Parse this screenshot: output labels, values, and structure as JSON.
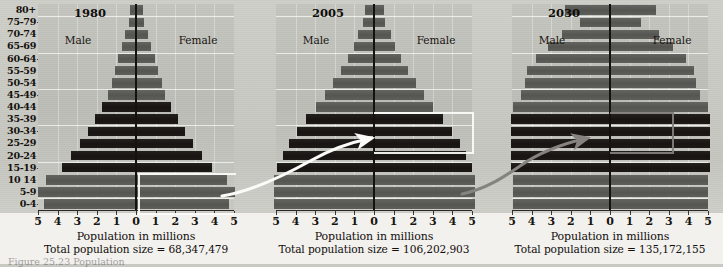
{
  "figure": {
    "age_groups": [
      "80+",
      "75-79",
      "70-74",
      "65-69",
      "60-64",
      "55-59",
      "50-54",
      "45-49",
      "40-44",
      "35-39",
      "30-34",
      "25-29",
      "20-24",
      "15-19",
      "10 14",
      "5-9",
      "0-4"
    ],
    "x_tick_labels": [
      "5",
      "4",
      "3",
      "2",
      "1",
      "0",
      "1",
      "2",
      "3",
      "4",
      "5"
    ],
    "axis_caption": "Population in millions",
    "male_label": "Male",
    "female_label": "Female",
    "colors": {
      "bar_dark": "#1a1715",
      "bar_mid": "#5a5a56",
      "plot_background": "#c2c2bc",
      "page_background": "#cfcfc9",
      "gridline": "#ffffff",
      "axis": "#14110f",
      "arrow_white": "#fbfbf9",
      "arrow_gray": "#807e7a"
    },
    "partial_bottom_caption": "Figure  25.23   Population"
  },
  "chart_data": [
    {
      "type": "bar",
      "title": "1980",
      "subtitle": "Total population size = 68,347,479",
      "total_population": "68,347,479",
      "xlabel": "Population in millions",
      "ylabel": "",
      "xlim": [
        -5,
        5
      ],
      "grid": true,
      "legend_position": "inline-left-right",
      "categories": [
        "80+",
        "75-79",
        "70-74",
        "65-69",
        "60-64",
        "55-59",
        "50-54",
        "45-49",
        "40-44",
        "35-39",
        "30-34",
        "25-29",
        "20-24",
        "15-19",
        "10 14",
        "5-9",
        "0-4"
      ],
      "series": [
        {
          "name": "Male",
          "values": [
            0.3,
            0.35,
            0.55,
            0.7,
            0.9,
            1.05,
            1.25,
            1.45,
            1.75,
            2.1,
            2.45,
            2.85,
            3.3,
            3.8,
            4.6,
            5.0,
            4.7
          ]
        },
        {
          "name": "Female",
          "values": [
            0.35,
            0.4,
            0.6,
            0.75,
            0.95,
            1.1,
            1.3,
            1.5,
            1.8,
            2.15,
            2.5,
            2.9,
            3.35,
            3.85,
            4.65,
            5.05,
            4.75
          ]
        }
      ],
      "bar_shades": [
        "mid",
        "mid",
        "mid",
        "mid",
        "mid",
        "mid",
        "mid",
        "mid",
        "dark",
        "dark",
        "dark",
        "dark",
        "dark",
        "dark",
        "mid",
        "mid",
        "mid"
      ],
      "annotation": "white bracket around 0-4 / 5-9 / 10 14 cohort (baby boom)"
    },
    {
      "type": "bar",
      "title": "2005",
      "subtitle": "Total population size = 106,202,903",
      "total_population": "106,202,903",
      "xlabel": "Population in millions",
      "ylabel": "",
      "xlim": [
        -5,
        5
      ],
      "grid": true,
      "legend_position": "inline-left-right",
      "categories": [
        "80+",
        "75-79",
        "70-74",
        "65-69",
        "60-64",
        "55-59",
        "50-54",
        "45-49",
        "40-44",
        "35-39",
        "30-34",
        "25-29",
        "20-24",
        "15-19",
        "10 14",
        "5-9",
        "0-4"
      ],
      "series": [
        {
          "name": "Male",
          "values": [
            0.45,
            0.55,
            0.8,
            1.0,
            1.35,
            1.7,
            2.1,
            2.5,
            2.95,
            3.45,
            3.95,
            4.35,
            4.65,
            4.95,
            5.1,
            5.1,
            5.1
          ]
        },
        {
          "name": "Female",
          "values": [
            0.5,
            0.58,
            0.85,
            1.05,
            1.4,
            1.75,
            2.15,
            2.55,
            3.0,
            3.5,
            4.0,
            4.4,
            4.7,
            5.0,
            5.15,
            5.15,
            5.15
          ]
        }
      ],
      "bar_shades": [
        "mid",
        "mid",
        "mid",
        "mid",
        "mid",
        "mid",
        "mid",
        "mid",
        "mid",
        "dark",
        "dark",
        "dark",
        "dark",
        "dark",
        "mid",
        "mid",
        "mid"
      ],
      "annotation": "white curved arrow from 1980 baby-boom cohort; white bracket around 25-29 to 35-39"
    },
    {
      "type": "bar",
      "title": "2030",
      "subtitle": "Total population size = 135,172,155",
      "total_population": "135,172,155",
      "xlabel": "Population in millions",
      "ylabel": "",
      "xlim": [
        -5,
        5
      ],
      "grid": true,
      "legend_position": "inline-left-right",
      "categories": [
        "80+",
        "75-79",
        "70-74",
        "65-69",
        "60-64",
        "55-59",
        "50-54",
        "45-49",
        "40-44",
        "35-39",
        "30-34",
        "25-29",
        "20-24",
        "15-19",
        "10 14",
        "5-9",
        "0-4"
      ],
      "series": [
        {
          "name": "Male",
          "values": [
            2.3,
            1.55,
            2.45,
            3.15,
            3.8,
            4.25,
            4.35,
            4.55,
            4.95,
            5.05,
            5.05,
            5.05,
            5.05,
            5.05,
            4.95,
            4.95,
            4.95
          ]
        },
        {
          "name": "Female",
          "values": [
            2.35,
            1.6,
            2.5,
            3.2,
            3.85,
            4.3,
            4.4,
            4.6,
            5.0,
            5.1,
            5.1,
            5.1,
            5.1,
            5.1,
            5.0,
            5.0,
            5.0
          ]
        }
      ],
      "bar_shades": [
        "mid",
        "mid",
        "mid",
        "mid",
        "mid",
        "mid",
        "mid",
        "mid",
        "mid",
        "dark",
        "dark",
        "dark",
        "dark",
        "dark",
        "mid",
        "mid",
        "mid"
      ],
      "annotation": "gray arrow from 2005 cohort; gray bracket around 25-29 to 35-39"
    }
  ]
}
